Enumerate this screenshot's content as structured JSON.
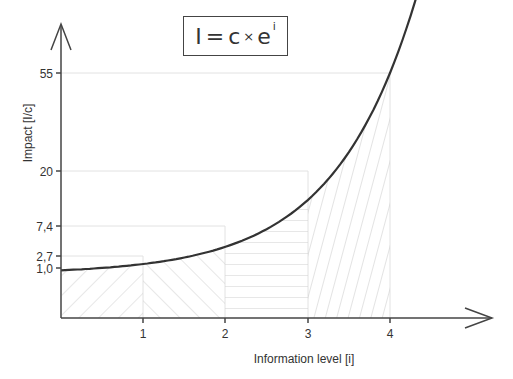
{
  "chart_data": {
    "type": "line",
    "formula": {
      "lhs": "I",
      "eq": "=",
      "c": "c",
      "times": "×",
      "base": "e",
      "exponent": "i"
    },
    "xlabel": "Information level [i]",
    "ylabel": "Impact [I/c]",
    "x_ticks": [
      "1",
      "2",
      "3",
      "4"
    ],
    "y_ticks": [
      "1,0",
      "2,7",
      "7,4",
      "20",
      "55"
    ],
    "series": [
      {
        "name": "I/c = e^i",
        "x": [
          0,
          1,
          2,
          3,
          4
        ],
        "values": [
          1.0,
          2.7,
          7.4,
          20,
          55
        ]
      }
    ],
    "shaded_regions": [
      {
        "from": 0,
        "to": 1,
        "pattern": "diagonal-forward"
      },
      {
        "from": 1,
        "to": 2,
        "pattern": "diagonal-backward"
      },
      {
        "from": 2,
        "to": 3,
        "pattern": "horizontal"
      },
      {
        "from": 3,
        "to": 4,
        "pattern": "steep-diagonal"
      }
    ],
    "xlim": [
      0,
      4.4
    ],
    "grid": "dotted guide lines at tick values",
    "colors": {
      "curve": "#333333",
      "axis": "#444444",
      "hatch": "#c8c8c8"
    }
  }
}
